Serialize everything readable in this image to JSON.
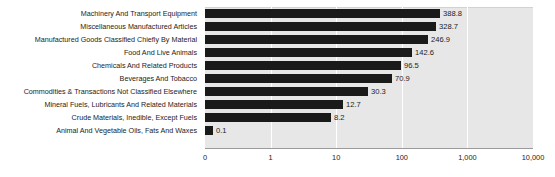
{
  "chart_data": {
    "type": "bar",
    "orientation": "horizontal",
    "title": "",
    "xlabel": "",
    "ylabel": "",
    "scale": "log",
    "grid": true,
    "legend": false,
    "axis_ticks": [
      "0",
      "1",
      "10",
      "100",
      "1,000",
      "10,000"
    ],
    "axis_tick_values": [
      0,
      1,
      10,
      100,
      1000,
      10000
    ],
    "xlim": [
      0,
      10000
    ],
    "categories": [
      "Machinery And Transport Equipment",
      "Miscellaneous Manufactured Articles",
      "Manufactured Goods Classified Chiefly By Material",
      "Food And Live Animals",
      "Chemicals And Related Products",
      "Beverages And Tobacco",
      "Commodities & Transactions Not Classified Elsewhere",
      "Mineral Fuels, Lubricants And Related Materials",
      "Crude Materials, Inedible, Except Fuels",
      "Animal And Vegetable Oils, Fats And Waxes"
    ],
    "values": [
      388.8,
      328.7,
      246.9,
      142.6,
      96.5,
      70.9,
      30.3,
      12.7,
      8.2,
      0.1
    ],
    "value_labels": [
      "388.8",
      "328.7",
      "246.9",
      "142.6",
      "96.5",
      "70.9",
      "30.3",
      "12.7",
      "8.2",
      "0.1"
    ],
    "bar_color": "#1a1a1a",
    "plot_background": "#e7e7e7",
    "gridline_color": "#ffffff"
  }
}
